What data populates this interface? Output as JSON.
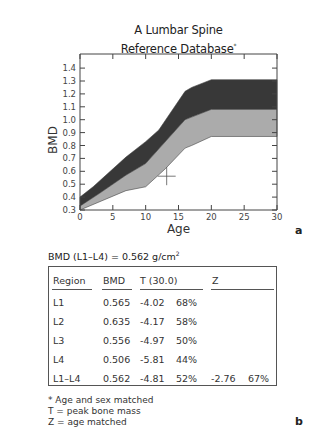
{
  "title": {
    "line1": "A Lumbar Spine",
    "line2": "Reference Database",
    "marker": "*"
  },
  "panel_labels": {
    "a": "a",
    "b": "b"
  },
  "chart_data": {
    "type": "area",
    "title": "A Lumbar Spine Reference Database*",
    "xlabel": "Age",
    "ylabel": "BMD",
    "xlim": [
      0,
      30
    ],
    "ylim": [
      0.3,
      1.45
    ],
    "x_ticks": [
      0,
      5,
      10,
      15,
      20,
      25,
      30
    ],
    "y_ticks": [
      0.3,
      0.4,
      0.5,
      0.6,
      0.7,
      0.8,
      0.9,
      1.0,
      1.1,
      1.2,
      1.3,
      1.4
    ],
    "grid": false,
    "legend": null,
    "series": [
      {
        "name": "upper boundary",
        "points": [
          [
            0,
            0.4
          ],
          [
            2,
            0.48
          ],
          [
            7,
            0.71
          ],
          [
            10,
            0.83
          ],
          [
            12,
            0.92
          ],
          [
            16,
            1.22
          ],
          [
            17,
            1.25
          ],
          [
            20,
            1.31
          ],
          [
            30,
            1.31
          ]
        ]
      },
      {
        "name": "mean",
        "points": [
          [
            0,
            0.33
          ],
          [
            3,
            0.43
          ],
          [
            7,
            0.57
          ],
          [
            10,
            0.66
          ],
          [
            16,
            1.0
          ],
          [
            17,
            1.02
          ],
          [
            20,
            1.08
          ],
          [
            30,
            1.08
          ]
        ]
      },
      {
        "name": "lower boundary",
        "points": [
          [
            0,
            0.3
          ],
          [
            7,
            0.45
          ],
          [
            10,
            0.48
          ],
          [
            13,
            0.62
          ],
          [
            16,
            0.78
          ],
          [
            17,
            0.8
          ],
          [
            20,
            0.87
          ],
          [
            30,
            0.87
          ]
        ]
      }
    ],
    "bands": [
      {
        "name": "upper band",
        "color": "#383838",
        "between": [
          "upper boundary",
          "mean"
        ]
      },
      {
        "name": "lower band",
        "color": "#ababab",
        "between": [
          "mean",
          "lower boundary"
        ]
      }
    ],
    "patient_marker": {
      "age": 13.2,
      "bmd": 0.562,
      "shape": "crosshair"
    }
  },
  "summary": {
    "label": "BMD (L1–L4) = 0.562 g/cm",
    "superscript": "2"
  },
  "table": {
    "headers": [
      "Region",
      "BMD",
      "T (30.0)",
      "Z"
    ],
    "rows": [
      [
        "L1",
        "0.565",
        "-4.02",
        "68%",
        "",
        ""
      ],
      [
        "L2",
        "0.635",
        "-4.17",
        "58%",
        "",
        ""
      ],
      [
        "L3",
        "0.556",
        "-4.97",
        "50%",
        "",
        ""
      ],
      [
        "L4",
        "0.506",
        "-5.81",
        "44%",
        "",
        ""
      ],
      [
        "L1–L4",
        "0.562",
        "-4.81",
        "52%",
        "-2.76",
        "67%"
      ]
    ]
  },
  "footnotes": [
    "* Age and sex matched",
    "T = peak bone mass",
    "Z = age matched"
  ]
}
